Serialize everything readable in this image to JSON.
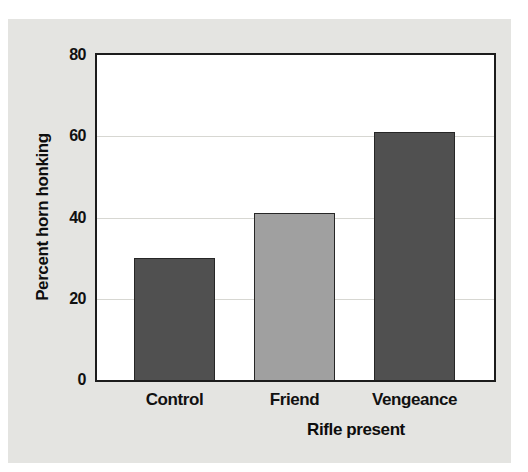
{
  "figure": {
    "panel_background": "#e4e4e1",
    "plot_background": "#ffffff",
    "axis_frame_color": "#1c1c1c",
    "gridline_color": "#d7d7d2",
    "text_color": "#111111"
  },
  "chart_data": {
    "type": "bar",
    "title": "",
    "xlabel": "Rifle present",
    "ylabel": "Percent horn honking",
    "categories": [
      "Control",
      "Friend",
      "Vengeance"
    ],
    "values": [
      30,
      41,
      61
    ],
    "bar_colors": [
      "#505050",
      "#a0a0a0",
      "#505050"
    ],
    "ylim": [
      0,
      80
    ],
    "yticks": [
      0,
      20,
      40,
      60,
      80
    ],
    "gridlines": [
      20,
      40,
      60
    ],
    "grid": "horizontal-faint",
    "legend": "none"
  }
}
